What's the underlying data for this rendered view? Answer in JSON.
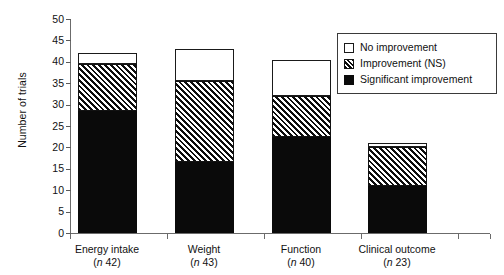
{
  "chart_data": {
    "type": "bar",
    "stacked": true,
    "title": "",
    "xlabel": "",
    "ylabel": "Number of trials",
    "ylim": [
      0,
      50
    ],
    "yticks": [
      0,
      5,
      10,
      15,
      20,
      25,
      30,
      35,
      40,
      45,
      50
    ],
    "grid": false,
    "legend_position": "top-right",
    "categories": [
      "Energy intake",
      "Weight",
      "Function",
      "Clinical outcome"
    ],
    "category_n": [
      "(n 42)",
      "(n 43)",
      "(n 40)",
      "(n 23)"
    ],
    "category_n_prefix": "n",
    "category_n_values": [
      42,
      43,
      40,
      23
    ],
    "series": [
      {
        "name": "Significant improvement",
        "fill": "solid-black",
        "values": [
          28.5,
          16.5,
          22.5,
          11
        ]
      },
      {
        "name": "Improvement (NS)",
        "fill": "diagonal-hatch",
        "values": [
          11,
          19,
          9.5,
          9
        ]
      },
      {
        "name": "No improvement",
        "fill": "white",
        "values": [
          2.5,
          7.5,
          8.5,
          1
        ]
      }
    ],
    "totals": [
      42,
      43,
      40.5,
      21
    ],
    "colors": {
      "significant": "#0a0a0a",
      "ns_hatch": "#0d0d0d",
      "no_improvement": "#ffffff",
      "axis": "#6b6b6b",
      "text": "#111111"
    }
  },
  "legend": {
    "items": [
      {
        "label": "No improvement",
        "swatch": "white-square-icon"
      },
      {
        "label": "Improvement (NS)",
        "swatch": "hatched-square-icon"
      },
      {
        "label": "Significant improvement",
        "swatch": "black-square-icon"
      }
    ]
  },
  "axes": {
    "y_title": "Number of trials",
    "y_labels": [
      "50",
      "45",
      "40",
      "35",
      "30",
      "25",
      "20",
      "15",
      "10",
      "5",
      "0"
    ],
    "x_labels": [
      {
        "name": "Energy intake",
        "n": "(n 42)"
      },
      {
        "name": "Weight",
        "n": "(n 43)"
      },
      {
        "name": "Function",
        "n": "(n 40)"
      },
      {
        "name": "Clinical outcome",
        "n": "(n 23)"
      }
    ]
  }
}
